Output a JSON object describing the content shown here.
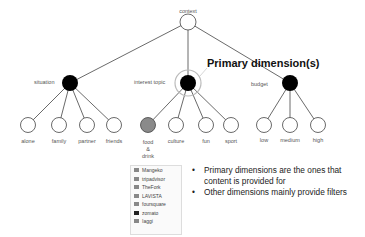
{
  "diagram": {
    "root": {
      "label": "context",
      "x": 188,
      "y": 22
    },
    "dimensions": [
      {
        "label": "situation",
        "x": 70,
        "y": 83,
        "primary": false,
        "children": [
          {
            "label": "alone",
            "x": 28
          },
          {
            "label": "family",
            "x": 59
          },
          {
            "label": "partner",
            "x": 87
          },
          {
            "label": "friends",
            "x": 114
          }
        ]
      },
      {
        "label": "interest topic",
        "x": 188,
        "y": 83,
        "primary": true,
        "children": [
          {
            "label": "food & drink",
            "x": 148,
            "highlighted": true
          },
          {
            "label": "culture",
            "x": 176
          },
          {
            "label": "fun",
            "x": 206
          },
          {
            "label": "sport",
            "x": 231
          }
        ]
      },
      {
        "label": "budget",
        "x": 290,
        "y": 83,
        "primary": false,
        "children": [
          {
            "label": "low",
            "x": 264
          },
          {
            "label": "medium",
            "x": 290
          },
          {
            "label": "high",
            "x": 318
          }
        ]
      }
    ],
    "leaf_y": 125,
    "callout": "Primary dimension(s)",
    "food_lines": [
      "food",
      "&",
      "drink"
    ],
    "colors": {
      "dimension_node": "#000000",
      "leaf_node": "#ffffff",
      "highlight_node": "#8a8a8a",
      "edge": "#444444"
    }
  },
  "logos": [
    {
      "name": "Mangeko",
      "dark": false
    },
    {
      "name": "tripadvisor",
      "dark": false
    },
    {
      "name": "TheFork",
      "dark": false
    },
    {
      "name": "LAVISTA",
      "dark": false
    },
    {
      "name": "foursquare",
      "dark": false
    },
    {
      "name": "zomato",
      "dark": true
    },
    {
      "name": "Iaggi",
      "dark": false
    }
  ],
  "bullets": [
    "Primary dimensions are the ones that content is provided for",
    "Other dimensions mainly provide filters"
  ]
}
